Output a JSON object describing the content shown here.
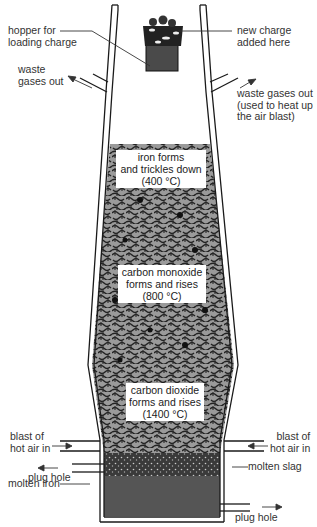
{
  "labels": {
    "hopper": [
      "hopper for",
      "loading charge"
    ],
    "new_charge": [
      "new charge",
      "added here"
    ],
    "waste_left": [
      "waste",
      "gases out"
    ],
    "waste_right": [
      "waste gases out",
      "(used to heat up",
      "the air blast)"
    ],
    "blast_left": [
      "blast of",
      "hot air in"
    ],
    "blast_right": [
      "blast of",
      "hot air in"
    ],
    "plug_hole_left": "plug hole",
    "molten_iron": "molten iron",
    "molten_slag": "molten slag",
    "plug_hole_right": "plug hole"
  },
  "zones": [
    {
      "lines": [
        "iron forms",
        "and trickles down",
        "(400 °C)"
      ]
    },
    {
      "lines": [
        "carbon monoxide",
        "forms and rises",
        "(800 °C)"
      ]
    },
    {
      "lines": [
        "carbon dioxide",
        "forms and rises",
        "(1400 °C)"
      ]
    }
  ],
  "colors": {
    "outline": "#1a1a1a",
    "charge_texture": "#8a8a8a",
    "slag": "#555555",
    "molten_iron": "#555555",
    "hopper": "#4a4a4a"
  }
}
